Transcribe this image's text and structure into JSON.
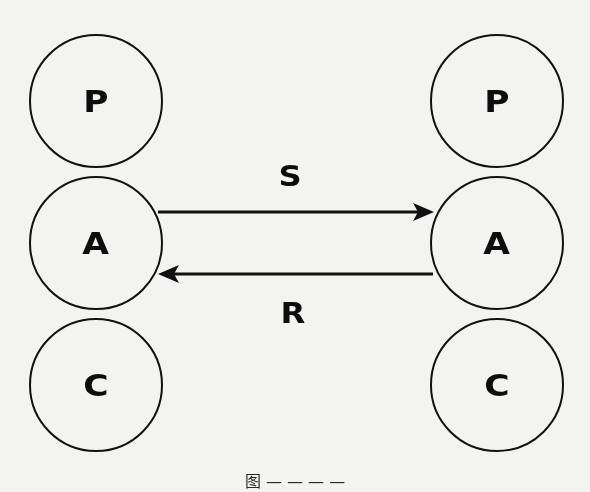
{
  "diagram": {
    "background_color": "#f3f3f2",
    "stroke_color": "#111111",
    "left_stack": {
      "nodes": [
        {
          "label": "P"
        },
        {
          "label": "A"
        },
        {
          "label": "C"
        }
      ]
    },
    "right_stack": {
      "nodes": [
        {
          "label": "P"
        },
        {
          "label": "A"
        },
        {
          "label": "C"
        }
      ]
    },
    "edges": [
      {
        "label": "S",
        "from": "left.A",
        "to": "right.A",
        "direction": "left-to-right"
      },
      {
        "label": "R",
        "from": "right.A",
        "to": "left.A",
        "direction": "right-to-left"
      }
    ],
    "caption": "图 — — — —"
  }
}
